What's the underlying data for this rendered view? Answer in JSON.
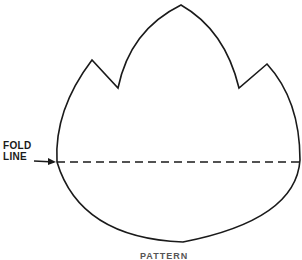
{
  "diagram": {
    "fold_label": {
      "line1": "FOLD",
      "line2": "LINE"
    },
    "caption": "PATTERN",
    "colors": {
      "stroke": "#1a1a1a",
      "background": "#ffffff"
    },
    "shape": {
      "type": "three-pointed pattern outline",
      "points": {
        "top_peak": [
          181,
          5
        ],
        "left_peak": [
          92,
          60
        ],
        "left_notch": [
          118,
          88
        ],
        "right_peak": [
          267,
          64
        ],
        "right_notch": [
          239,
          88
        ],
        "bottom": [
          183,
          242
        ]
      }
    },
    "fold_line": {
      "y": 162,
      "x_start": 57,
      "x_end": 300,
      "style": "dashed"
    }
  }
}
